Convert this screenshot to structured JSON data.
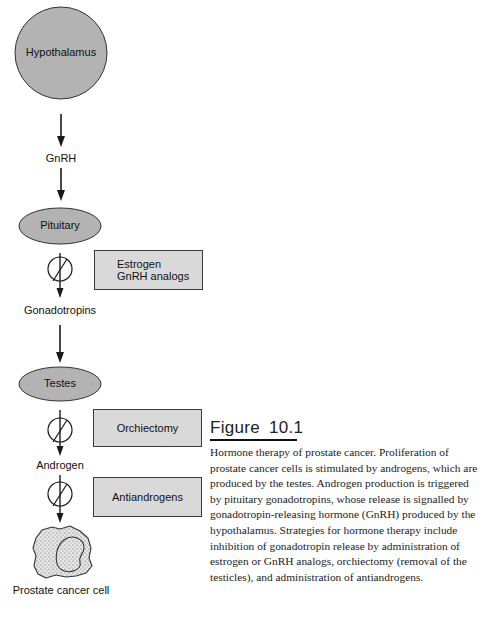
{
  "diagram": {
    "nodes": {
      "hypothalamus": "Hypothalamus",
      "pituitary": "Pituitary",
      "testes": "Testes",
      "prostate_cancer_cell": "Prostate cancer cell"
    },
    "signals": {
      "gnrh": "GnRH",
      "gonadotropins": "Gonadotropins",
      "androgen": "Androgen"
    },
    "interventions": {
      "estrogen_line1": "Estrogen",
      "estrogen_line2": "GnRH analogs",
      "orchiectomy": "Orchiectomy",
      "antiandrogens": "Antiandrogens"
    },
    "colors": {
      "node_fill": "#b3b3b3",
      "box_fill": "#d9d9d9",
      "stroke": "#222222"
    }
  },
  "figure": {
    "label": "Figure",
    "number": "10.1",
    "caption": "Hormone therapy of prostate cancer. Proliferation of prostate cancer cells is stimulated by androgens, which are produced by the testes. Androgen production is triggered by pituitary gonadotropins, whose release is signalled by gonadotropin-releasing hormone (GnRH) produced by the hypothalamus. Strategies for hormone therapy include inhibition of gonadotropin release by administration of estrogen or GnRH analogs, orchiectomy (removal of the testicles), and administration of antiandrogens."
  }
}
